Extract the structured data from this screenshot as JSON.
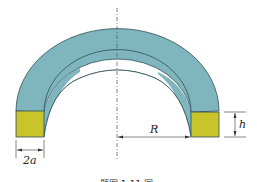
{
  "figure": {
    "type": "semicircular ring (half torus) with square cross-sections",
    "labels": {
      "radius": "R",
      "height": "h",
      "width": "2a"
    },
    "colors": {
      "ring_fill": "#7fb5bd",
      "ring_stroke": "#2f4f58",
      "cross_section_fill": "#c9c42a",
      "dim_line": "#333333",
      "axis_line": "#555555"
    },
    "caption": "题图 1-11 图"
  }
}
